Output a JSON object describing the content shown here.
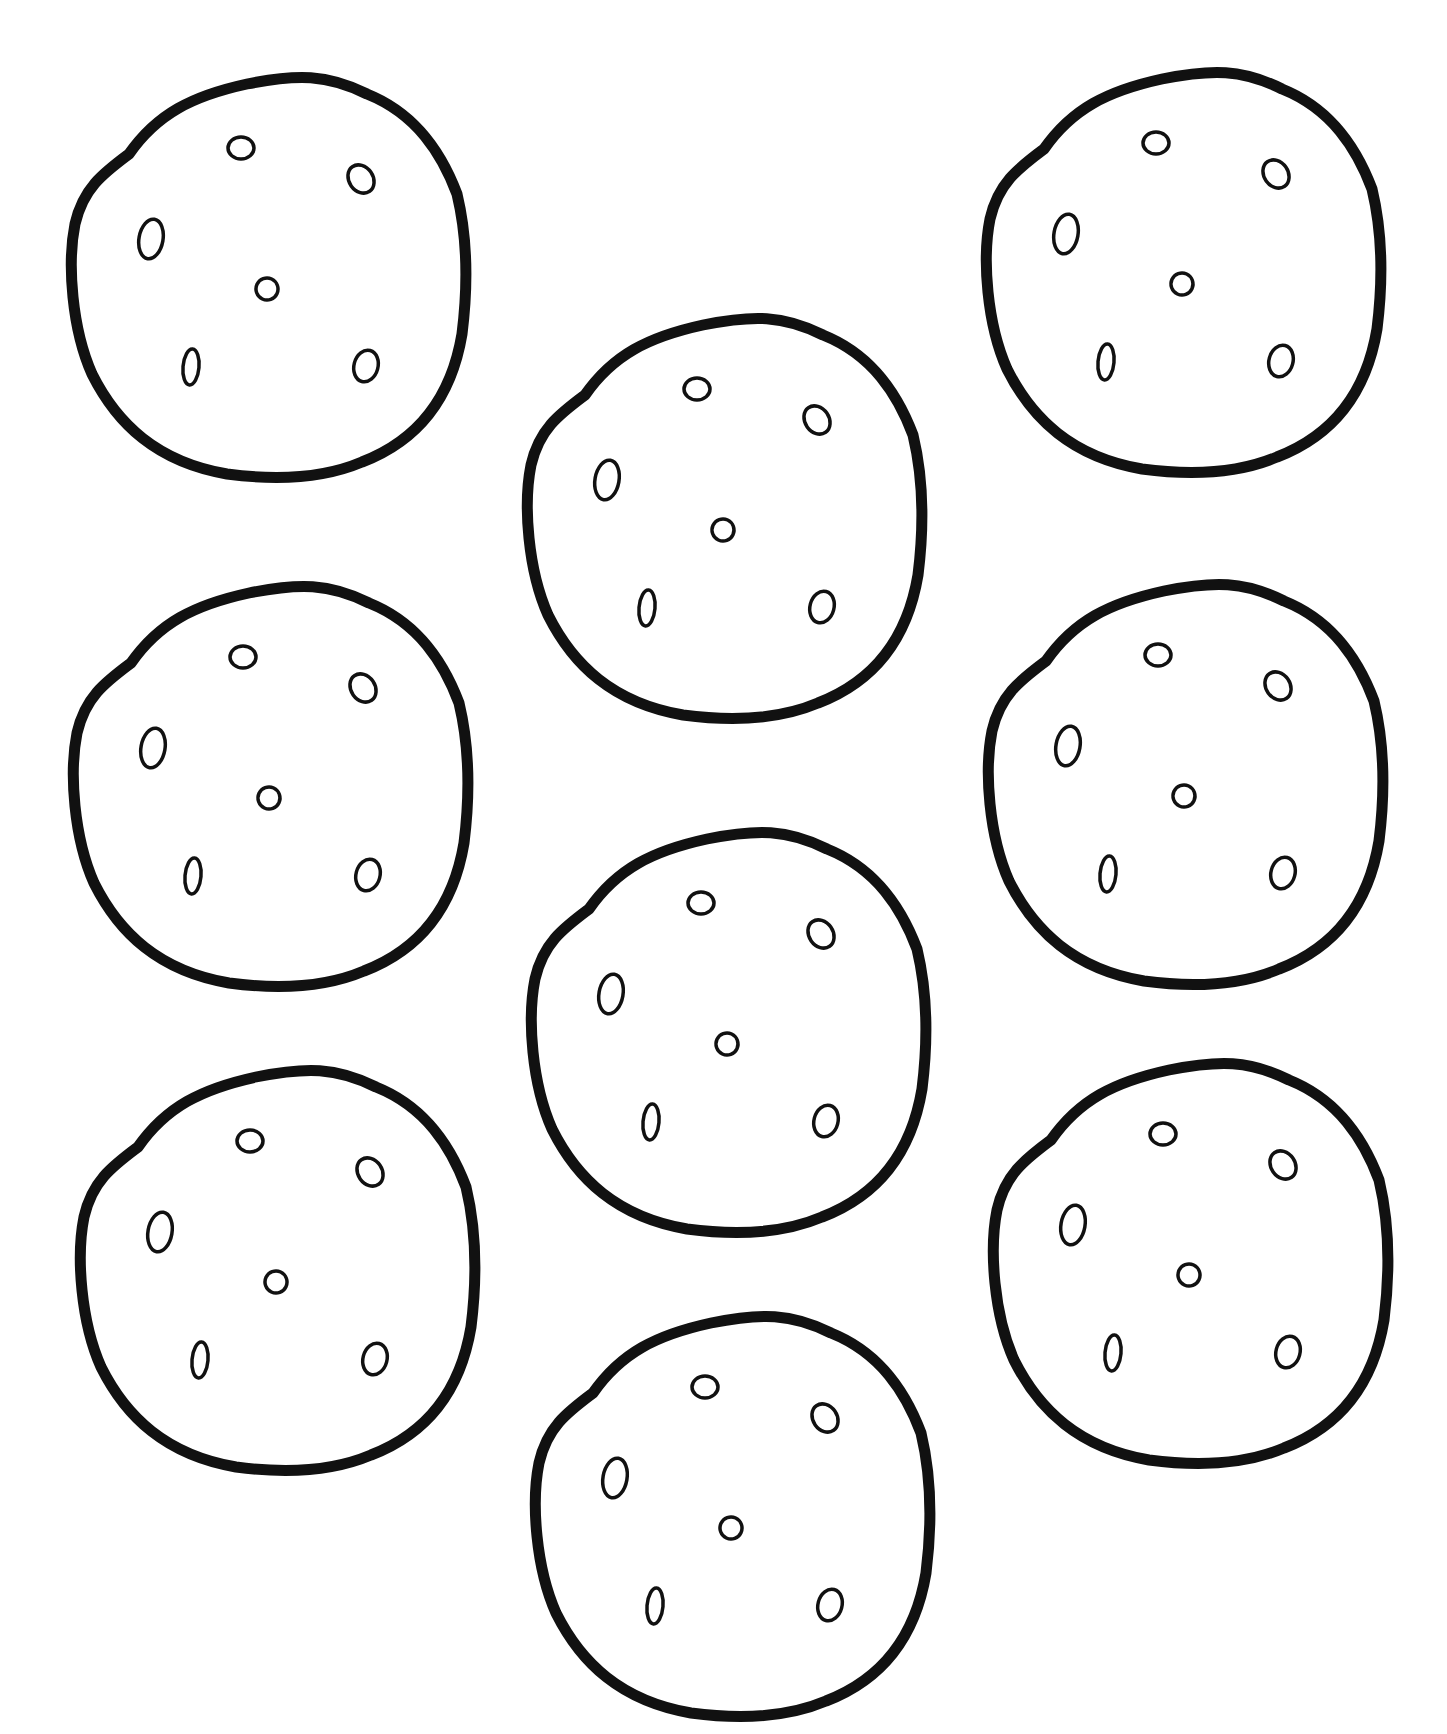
{
  "page": {
    "background": "#ffffff",
    "line_color": "#111111"
  },
  "cookies": [
    {
      "id": "top-left",
      "cx": 267,
      "cy": 274
    },
    {
      "id": "top-right",
      "cx": 1182,
      "cy": 269
    },
    {
      "id": "upper-center",
      "cx": 723,
      "cy": 515
    },
    {
      "id": "middle-left",
      "cx": 269,
      "cy": 783
    },
    {
      "id": "middle-right",
      "cx": 1184,
      "cy": 781
    },
    {
      "id": "center",
      "cx": 727,
      "cy": 1029
    },
    {
      "id": "lower-left",
      "cx": 276,
      "cy": 1267
    },
    {
      "id": "lower-right",
      "cx": 1189,
      "cy": 1260
    },
    {
      "id": "bottom-center",
      "cx": 731,
      "cy": 1513
    }
  ],
  "cookie_count": 9,
  "chips_per_cookie": 6
}
